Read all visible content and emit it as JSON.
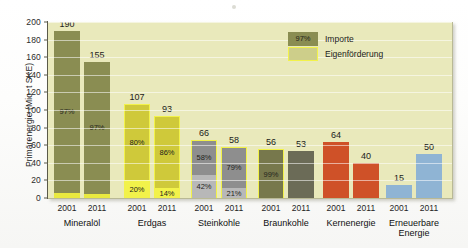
{
  "chart_data": {
    "type": "bar",
    "title": "",
    "xlabel": "",
    "ylabel": "Primärenergie (Mio. t SKE)",
    "ylim": [
      0,
      200
    ],
    "yticks": [
      0,
      20,
      40,
      60,
      80,
      100,
      120,
      140,
      160,
      180,
      200
    ],
    "grid": true,
    "legend_position": "inside-top-right",
    "legend": [
      {
        "label": "Importe",
        "swatch_text": "97%",
        "color": "#8a8d52"
      },
      {
        "label": "Eigenförderung",
        "swatch_text": "",
        "color": "#cdce8a"
      }
    ],
    "categories": [
      "Mineralöl",
      "Erdgas",
      "Steinkohle",
      "Braunkohle",
      "Kernenergie",
      "Erneuerbare Energie"
    ],
    "years": [
      "2001",
      "2011"
    ],
    "bars": [
      {
        "category": "Mineralöl",
        "year": "2001",
        "total": 190,
        "import_pct": "97%",
        "own_pct": "",
        "import_share": 97,
        "own_share": 3,
        "import_color": "#8a8d52",
        "own_color": "#e9e93f",
        "outlined": false
      },
      {
        "category": "Mineralöl",
        "year": "2011",
        "total": 155,
        "import_pct": "97%",
        "own_pct": "",
        "import_share": 97,
        "own_share": 3,
        "import_color": "#8a8d52",
        "own_color": "#e9e93f",
        "outlined": false
      },
      {
        "category": "Erdgas",
        "year": "2001",
        "total": 107,
        "import_pct": "80%",
        "own_pct": "20%",
        "import_share": 80,
        "own_share": 20,
        "import_color": "#cfc93a",
        "own_color": "#f2f24a",
        "outlined": true
      },
      {
        "category": "Erdgas",
        "year": "2011",
        "total": 93,
        "import_pct": "86%",
        "own_pct": "14%",
        "import_share": 86,
        "own_share": 14,
        "import_color": "#cfc93a",
        "own_color": "#f2f24a",
        "outlined": true
      },
      {
        "category": "Steinkohle",
        "year": "2001",
        "total": 66,
        "import_pct": "58%",
        "own_pct": "42%",
        "import_share": 58,
        "own_share": 42,
        "import_color": "#8e8e8e",
        "own_color": "#b8b8b8",
        "outlined": true
      },
      {
        "category": "Steinkohle",
        "year": "2011",
        "total": 58,
        "import_pct": "79%",
        "own_pct": "21%",
        "import_share": 79,
        "own_share": 21,
        "import_color": "#8e8e8e",
        "own_color": "#b8b8b8",
        "outlined": true
      },
      {
        "category": "Braunkohle",
        "year": "2001",
        "total": 56,
        "import_pct": "1%",
        "own_pct": "99%",
        "import_share": 1,
        "own_share": 99,
        "import_color": "#77784c",
        "own_color": "#77784c",
        "outlined": true
      },
      {
        "category": "Braunkohle",
        "year": "2011",
        "total": 53,
        "import_pct": "",
        "own_pct": "",
        "import_share": 0,
        "own_share": 100,
        "import_color": "#6b6b57",
        "own_color": "#6b6b57",
        "outlined": false
      },
      {
        "category": "Kernenergie",
        "year": "2001",
        "total": 64,
        "import_pct": "",
        "own_pct": "",
        "import_share": 0,
        "own_share": 100,
        "import_color": "#cf5128",
        "own_color": "#cf5128",
        "outlined": false
      },
      {
        "category": "Kernenergie",
        "year": "2011",
        "total": 40,
        "import_pct": "",
        "own_pct": "",
        "import_share": 0,
        "own_share": 100,
        "import_color": "#cf5128",
        "own_color": "#cf5128",
        "outlined": false
      },
      {
        "category": "Erneuerbare Energie",
        "year": "2001",
        "total": 15,
        "import_pct": "",
        "own_pct": "",
        "import_share": 0,
        "own_share": 100,
        "import_color": "#8fb4d4",
        "own_color": "#8fb4d4",
        "outlined": false
      },
      {
        "category": "Erneuerbare Energie",
        "year": "2011",
        "total": 50,
        "import_pct": "",
        "own_pct": "",
        "import_share": 0,
        "own_share": 100,
        "import_color": "#8fb4d4",
        "own_color": "#8fb4d4",
        "outlined": false
      }
    ]
  },
  "colors": {
    "plot_background": "#e9e9bb",
    "page_background": "#ffffff",
    "axis": "#5a5a4a",
    "import_olive": "#8a8d52",
    "own_yellow": "#f2f24a",
    "gas_yellow": "#cfc93a",
    "coal_gray": "#8e8e8e",
    "lignite_olive": "#77784c",
    "nuclear_orange": "#cf5128",
    "renewable_blue": "#8fb4d4"
  }
}
